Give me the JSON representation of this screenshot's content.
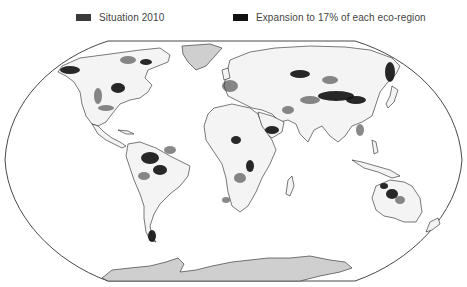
{
  "legend": {
    "items": [
      {
        "label": "Situation 2010",
        "color": "#3a3a3a"
      },
      {
        "label": "Expansion to 17% of each eco-region",
        "color": "#111111"
      }
    ]
  },
  "map": {
    "projection": "Robinson",
    "land_fill": "#f4f4f4",
    "land_stroke": "#222222",
    "ice_fill": "#cfcfcf",
    "ocean_fill": "#ffffff",
    "outline_color": "#333333"
  }
}
